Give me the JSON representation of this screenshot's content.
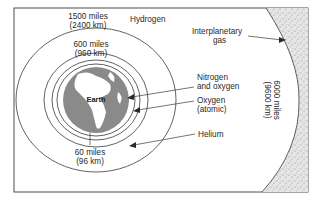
{
  "diagram": {
    "layers": [
      {
        "name": "Hydrogen",
        "boundary_miles": "1500 miles",
        "boundary_km": "(2400 km)"
      },
      {
        "name": "Helium",
        "boundary_miles": "600 miles",
        "boundary_km": "(960 km)"
      },
      {
        "name": "Oxygen (atomic)"
      },
      {
        "name": "Nitrogen and oxygen",
        "boundary_miles": "60 miles",
        "boundary_km": "(96 km)"
      }
    ],
    "labels": {
      "earth": "Earth",
      "hydrogen": "Hydrogen",
      "interplanetary_line1": "Interplanetary",
      "interplanetary_line2": "gas",
      "nitrogen_line1": "Nitrogen",
      "nitrogen_line2": "and oxygen",
      "oxygen_line1": "Oxygen",
      "oxygen_line2": "(atomic)",
      "helium": "Helium",
      "r1500_miles": "1500 miles",
      "r1500_km": "(2400 km)",
      "r600_miles": "600 miles",
      "r600_km": "(960 km)",
      "r60_miles": "60 miles",
      "r60_km": "(96 km)",
      "r6000_miles": "6000 miles",
      "r6000_km": "(9600 km)"
    },
    "colors": {
      "earth_ocean": "#8a8a8a",
      "earth_land": "#ffffff",
      "interplanetary": "#d9d9d9",
      "line": "#3a3a3a"
    }
  }
}
